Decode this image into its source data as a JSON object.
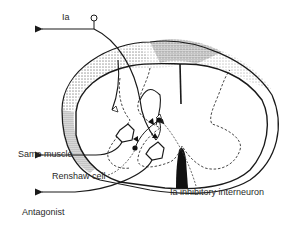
{
  "diagram": {
    "labels": {
      "ia_afferent": "Ia",
      "same_muscle": "Same muscle",
      "renshaw_cell": "Renshaw cell",
      "antagonist": "Antagonist",
      "ia_interneuron": "Ia inhibitory interneuron"
    },
    "colors": {
      "ink": "#1a1a1a",
      "background": "#ffffff"
    }
  }
}
